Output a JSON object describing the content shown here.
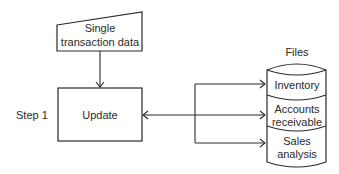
{
  "diagram": {
    "type": "system flowchart",
    "input": {
      "shape": "manual-input",
      "line1": "Single",
      "line2": "transaction data"
    },
    "process": {
      "shape": "process-box",
      "label": "Update",
      "step_label": "Step 1"
    },
    "files": {
      "title": "Files",
      "shape": "stacked-storage-cylinder",
      "segments": [
        {
          "line1": "Inventory",
          "line2": ""
        },
        {
          "line1": "Accounts",
          "line2": "receivable"
        },
        {
          "line1": "Sales",
          "line2": "analysis"
        }
      ]
    },
    "connections": [
      {
        "from": "input",
        "to": "process",
        "direction": "one-way"
      },
      {
        "from": "process",
        "to": "files",
        "direction": "two-way",
        "branches": [
          "Inventory",
          "Accounts receivable",
          "Sales analysis"
        ]
      }
    ],
    "colors": {
      "stroke": "#2a2a2a",
      "background": "#ffffff"
    }
  }
}
